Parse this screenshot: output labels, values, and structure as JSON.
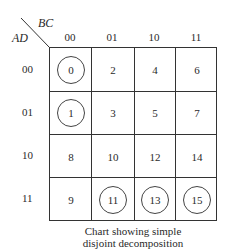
{
  "axes": {
    "col_var": "BC",
    "row_var": "AD",
    "col_headers": [
      "00",
      "01",
      "10",
      "11"
    ],
    "row_headers": [
      "00",
      "01",
      "10",
      "11"
    ]
  },
  "cells": [
    [
      {
        "v": "0",
        "circled": true
      },
      {
        "v": "2",
        "circled": false
      },
      {
        "v": "4",
        "circled": false
      },
      {
        "v": "6",
        "circled": false
      }
    ],
    [
      {
        "v": "1",
        "circled": true
      },
      {
        "v": "3",
        "circled": false
      },
      {
        "v": "5",
        "circled": false
      },
      {
        "v": "7",
        "circled": false
      }
    ],
    [
      {
        "v": "8",
        "circled": false
      },
      {
        "v": "10",
        "circled": false
      },
      {
        "v": "12",
        "circled": false
      },
      {
        "v": "14",
        "circled": false
      }
    ],
    [
      {
        "v": "9",
        "circled": false
      },
      {
        "v": "11",
        "circled": true
      },
      {
        "v": "13",
        "circled": true
      },
      {
        "v": "15",
        "circled": true
      }
    ]
  ],
  "caption": {
    "line1": "Chart showing simple",
    "line2": "disjoint decomposition"
  }
}
